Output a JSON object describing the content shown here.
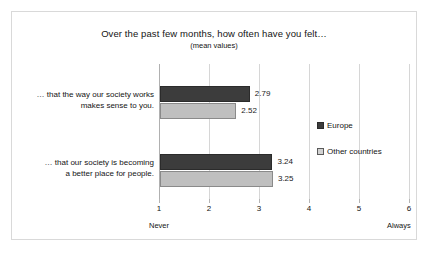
{
  "chart_data": {
    "type": "bar",
    "orientation": "horizontal",
    "title": "Over the past few months, how often have you felt…",
    "subtitle": "(mean values)",
    "categories": [
      "… that the way our society works makes sense to you.",
      "… that our society is becoming a better place for people."
    ],
    "category_lines": [
      [
        "… that the way our society works",
        "makes sense to you."
      ],
      [
        "… that our society is becoming",
        "a better place for people."
      ]
    ],
    "series": [
      {
        "name": "Europe",
        "values": [
          2.79,
          3.24
        ],
        "color": "#3c3c3c"
      },
      {
        "name": "Other countries",
        "values": [
          2.52,
          3.25
        ],
        "color": "#bfbfbf"
      }
    ],
    "value_labels": [
      [
        "2.79",
        "3.24"
      ],
      [
        "2.52",
        "3.25"
      ]
    ],
    "xlabel": "",
    "ylabel": "",
    "xlim": [
      1,
      6
    ],
    "xticks": [
      "1",
      "2",
      "3",
      "4",
      "5",
      "6"
    ],
    "scale_min_label": "Never",
    "scale_max_label": "Always",
    "grid": true,
    "legend_position": "right",
    "legend": [
      "Europe",
      "Other countries"
    ]
  },
  "legend_items": [
    {
      "label": "Europe",
      "swatch": "europe"
    },
    {
      "label": "Other countries",
      "swatch": "other"
    }
  ],
  "colors": {
    "europe": "#3c3c3c",
    "other_countries": "#bfbfbf",
    "border": "#d9d9d9",
    "gridline": "#d6d6d6",
    "text": "#141414"
  }
}
